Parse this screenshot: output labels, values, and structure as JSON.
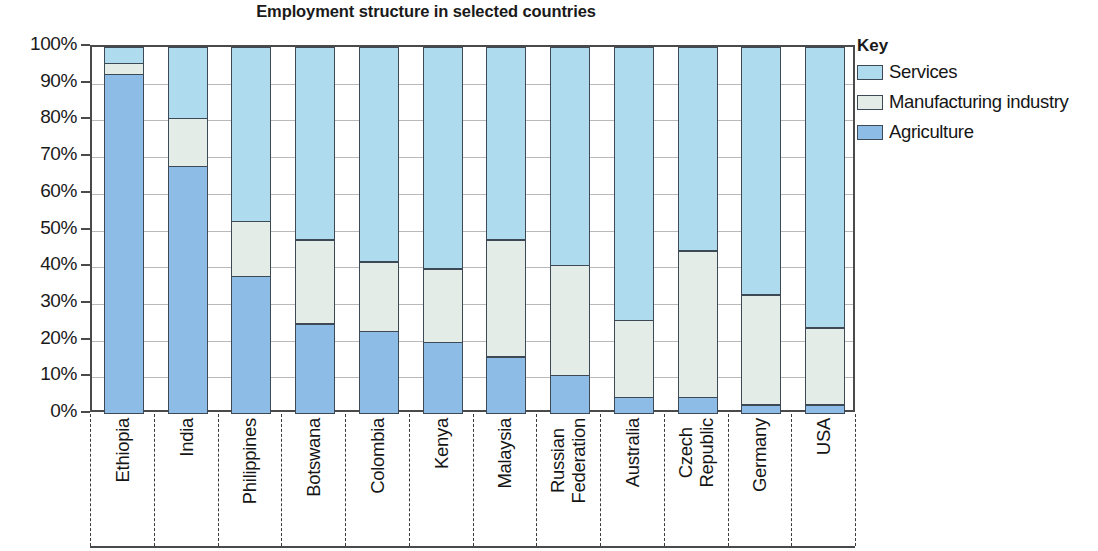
{
  "chart_data": {
    "type": "bar",
    "stacked": true,
    "orientation": "vertical",
    "title": "Employment structure in selected countries",
    "xlabel": "",
    "ylabel": "",
    "ylim": [
      0,
      100
    ],
    "yunit": "%",
    "ytick_labels": [
      "100%",
      "90%",
      "80%",
      "70%",
      "60%",
      "50%",
      "40%",
      "30%",
      "20%",
      "10%",
      "0%"
    ],
    "ytick_values": [
      100,
      90,
      80,
      70,
      60,
      50,
      40,
      30,
      20,
      10,
      0
    ],
    "grid": true,
    "legend_position": "right",
    "categories": [
      "Ethiopia",
      "India",
      "Philippines",
      "Botswana",
      "Colombia",
      "Kenya",
      "Malaysia",
      "Russian Federation",
      "Australia",
      "Czech Republic",
      "Germany",
      "USA"
    ],
    "category_label_lines": [
      [
        "Ethiopia"
      ],
      [
        "India"
      ],
      [
        "Philippines"
      ],
      [
        "Botswana"
      ],
      [
        "Colombia"
      ],
      [
        "Kenya"
      ],
      [
        "Malaysia"
      ],
      [
        "Russian",
        "Federation"
      ],
      [
        "Australia"
      ],
      [
        "Czech",
        "Republic"
      ],
      [
        "Germany"
      ],
      [
        "USA"
      ]
    ],
    "series": [
      {
        "name": "Agriculture",
        "color": "#8DBDE6",
        "values": [
          92,
          67,
          37,
          24,
          22,
          19,
          15,
          10,
          4,
          4,
          2,
          2
        ]
      },
      {
        "name": "Manufacturing industry",
        "color": "#E4ECE8",
        "values": [
          3,
          13,
          15,
          23,
          19,
          20,
          32,
          30,
          21,
          40,
          30,
          21
        ]
      },
      {
        "name": "Services",
        "color": "#AFDBEE",
        "values": [
          5,
          20,
          48,
          53,
          59,
          61,
          53,
          60,
          75,
          56,
          68,
          77
        ]
      }
    ],
    "cumulative_tops": {
      "agriculture": [
        92,
        67,
        37,
        24,
        22,
        19,
        15,
        10,
        4,
        4,
        2,
        2
      ],
      "manufacturing": [
        95,
        80,
        52,
        47,
        41,
        39,
        47,
        40,
        25,
        44,
        32,
        23
      ],
      "services": [
        100,
        100,
        100,
        100,
        100,
        100,
        100,
        100,
        100,
        100,
        100,
        100
      ]
    }
  },
  "legend": {
    "title": "Key",
    "entries": [
      {
        "label": "Services",
        "color": "#AFDBEE"
      },
      {
        "label": "Manufacturing industry",
        "color": "#E4ECE8"
      },
      {
        "label": "Agriculture",
        "color": "#8DBDE6"
      }
    ]
  },
  "colors": {
    "services": "#AFDBEE",
    "manufacturing": "#E4ECE8",
    "agriculture": "#8DBDE6",
    "outline": "#3d4a55",
    "axis": "#4a4a4a",
    "grid": "#b9b9b9",
    "text": "#151515"
  }
}
